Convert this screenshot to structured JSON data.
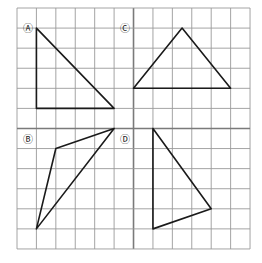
{
  "grid": {
    "x0": 17,
    "y0": 8,
    "cols": 12,
    "rows": 12,
    "cell_w": 19.42,
    "cell_h": 20.08,
    "line_color": "#9a9a9a",
    "heavy_line_color": "#7a7a7a",
    "heavy_index": 6
  },
  "stroke_color": "#1a1a1a",
  "shapes": [
    {
      "label": "Ⓐ",
      "name": "triangle-a",
      "label_pos": [
        0.55,
        1.0
      ],
      "points": [
        [
          1,
          1
        ],
        [
          1,
          5
        ],
        [
          5,
          5
        ]
      ]
    },
    {
      "label": "Ⓒ",
      "name": "triangle-c",
      "label_pos": [
        5.55,
        1.0
      ],
      "points": [
        [
          8.5,
          1
        ],
        [
          6,
          4
        ],
        [
          11,
          4
        ]
      ]
    },
    {
      "label": "Ⓑ",
      "name": "triangle-b",
      "label_pos": [
        0.55,
        6.5
      ],
      "points": [
        [
          5,
          6
        ],
        [
          2,
          7
        ],
        [
          1,
          11
        ]
      ]
    },
    {
      "label": "Ⓓ",
      "name": "triangle-d",
      "label_pos": [
        5.55,
        6.5
      ],
      "points": [
        [
          7,
          6
        ],
        [
          7,
          11
        ],
        [
          10,
          10
        ]
      ]
    }
  ]
}
